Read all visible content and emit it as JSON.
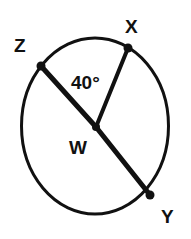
{
  "figure": {
    "type": "circle-geometry-diagram",
    "background_color": "#ffffff",
    "stroke_color": "#111111",
    "circle": {
      "center_label": "W",
      "center_x": 95,
      "center_y": 126,
      "radius_x": 73,
      "radius_y": 88,
      "stroke_width": 3
    },
    "points": [
      {
        "label": "Z",
        "x": 41,
        "y": 66,
        "on_circle": true
      },
      {
        "label": "X",
        "x": 128,
        "y": 48,
        "on_circle": true
      },
      {
        "label": "W",
        "x": 96,
        "y": 127,
        "on_circle": false
      },
      {
        "label": "Y",
        "x": 150,
        "y": 195,
        "on_circle": true
      }
    ],
    "segments": [
      {
        "name": "segment-ZW",
        "from": "Z",
        "to": "W"
      },
      {
        "name": "segment-WY",
        "from": "W",
        "to": "Y"
      },
      {
        "name": "segment-WX",
        "from": "W",
        "to": "X"
      }
    ],
    "angles": [
      {
        "name": "angle-ZWX",
        "vertex": "W",
        "rays": [
          "Z",
          "X"
        ],
        "value": "40°"
      }
    ],
    "labels": {
      "z": "Z",
      "x": "X",
      "w": "W",
      "y": "Y",
      "angle_zwx": "40°"
    }
  }
}
